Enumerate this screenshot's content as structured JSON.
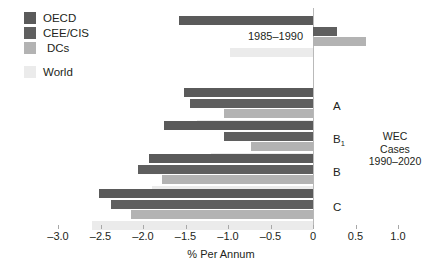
{
  "chart_data": {
    "type": "bar",
    "orientation": "horizontal",
    "title": "",
    "xlabel": "% Per Annum",
    "ylabel": "",
    "xlim": [
      -3.0,
      1.0
    ],
    "xticks": [
      -3.0,
      -2.5,
      -2.0,
      -1.5,
      -1.0,
      -0.5,
      0,
      0.5,
      1.0
    ],
    "xtick_labels": [
      "–3.0",
      "–2.5",
      "–2.0",
      "–1.5",
      "–1.0",
      "–0.5",
      "0",
      "0.5",
      "1.0"
    ],
    "grid": false,
    "legend_position": "top-left",
    "legend": [
      "OECD",
      "CEE/CIS",
      "DCs",
      "World"
    ],
    "series": [
      {
        "name": "OECD",
        "color": "#5a5a5a",
        "values": [
          -1.58,
          -1.52,
          -1.75,
          -1.93,
          -2.52
        ]
      },
      {
        "name": "CEE/CIS",
        "color": "#5f5f5f",
        "values": [
          0.28,
          -1.45,
          -1.05,
          -2.06,
          -2.38
        ]
      },
      {
        "name": "DCs",
        "color": "#b3b3b3",
        "values": [
          0.62,
          -1.05,
          -0.73,
          -1.78,
          -2.14
        ]
      },
      {
        "name": "World",
        "color": "#ebebeb",
        "values": [
          -0.98,
          -1.37,
          -1.2,
          -1.9,
          -2.6
        ]
      }
    ],
    "categories": [
      "1985–1990",
      "A",
      "B₁",
      "B",
      "C"
    ],
    "annotations": [
      {
        "text": "1985–1990",
        "role": "period-label"
      },
      {
        "text": "WEC",
        "role": "note-line-1"
      },
      {
        "text": "Cases",
        "role": "note-line-2"
      },
      {
        "text": "1990–2020",
        "role": "note-line-3"
      }
    ]
  },
  "legend": {
    "items": [
      {
        "label": "OECD",
        "color": "#5a5a5a"
      },
      {
        "label": "CEE/CIS",
        "color": "#5f5f5f"
      },
      {
        "label": "DCs",
        "color": "#b3b3b3"
      },
      {
        "label": "World",
        "color": "#ebebeb"
      }
    ]
  },
  "axis": {
    "title": "% Per Annum",
    "labels": [
      "–3.0",
      "–2.5",
      "–2.0",
      "–1.5",
      "–1.0",
      "–0.5",
      "0",
      "0.5",
      "1.0"
    ]
  },
  "groups": {
    "period": "1985–1990",
    "a": "A",
    "b1_main": "B",
    "b1_sub": "1",
    "b": "B",
    "c": "C"
  },
  "note": {
    "line1": "WEC",
    "line2": "Cases",
    "line3": "1990–2020"
  }
}
